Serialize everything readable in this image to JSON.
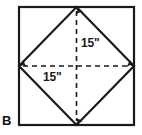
{
  "figure": {
    "panel_letter": "B",
    "colors": {
      "background": "#ffffff",
      "stroke": "#1a1a1a",
      "dashed": "#1a1a1a",
      "text": "#111111"
    },
    "square": {
      "name": "outer-square",
      "x": 19,
      "y": 7,
      "width": 115,
      "height": 118,
      "stroke_width": 2.2
    },
    "diamond": {
      "name": "inscribed-diamond",
      "points": "76.5,7 134,66 76.5,125 19,66",
      "stroke_width": 2.2
    },
    "diagonals": [
      {
        "name": "vertical-diagonal",
        "orientation": "vertical",
        "x1": 76.5,
        "y1": 9,
        "x2": 76.5,
        "y2": 123,
        "label": "15\"",
        "arrows": "both"
      },
      {
        "name": "horizontal-diagonal",
        "orientation": "horizontal",
        "x1": 21,
        "y1": 66,
        "x2": 132,
        "y2": 66,
        "label": "15\"",
        "arrows": "both"
      }
    ],
    "labels": {
      "vertical_measure": "15\"",
      "horizontal_measure": "15\""
    }
  }
}
